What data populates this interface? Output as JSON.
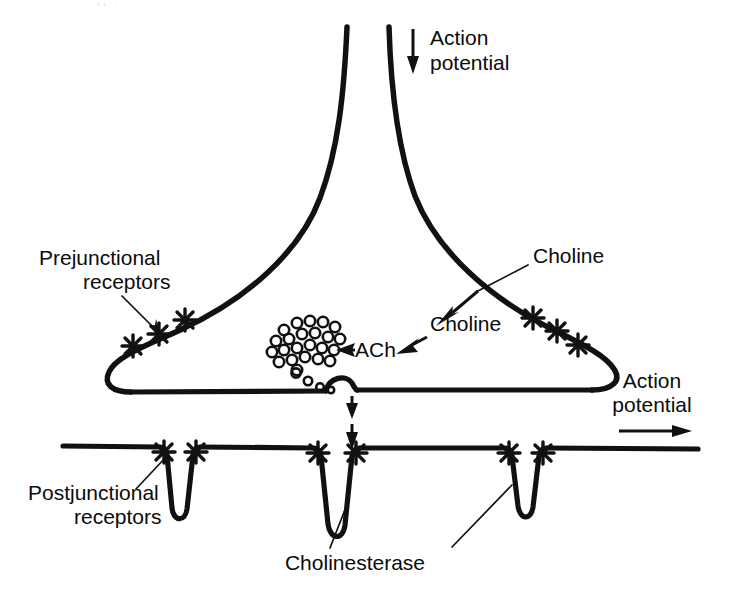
{
  "figure": {
    "background_color": "#ffffff",
    "ink_color": "#111111"
  },
  "labels": {
    "action_potential_top": "Action\npotential",
    "action_potential_top_line1": "Action",
    "action_potential_top_line2": "potential",
    "action_potential_right_line1": "Action",
    "action_potential_right_line2": "potential",
    "prejunctional_receptors_line1": "Prejunctional",
    "prejunctional_receptors_line2": "receptors",
    "postjunctional_receptors_line1": "Postjunctional",
    "postjunctional_receptors_line2": "receptors",
    "choline_outer": "Choline",
    "choline_inner": "Choline",
    "ach": "ACh",
    "cholinesterase": "Cholinesterase"
  },
  "structures": {
    "axon": "nerve axon flaring into terminal bouton",
    "nerve_terminal": "presynaptic nerve terminal (bouton)",
    "release_site": "vesicle fusion / release site bump on terminal membrane",
    "synaptic_cleft": "synaptic cleft between terminal and muscle membrane",
    "postjunctional_membrane": "postjunctional (muscle) membrane with junctional folds",
    "junctional_folds_count": 3,
    "prejunctional_receptor_marks_left": 3,
    "prejunctional_receptor_marks_right": 3,
    "postjunctional_receptor_mark_pairs": 3,
    "vesicle_cluster_count": 23,
    "released_vesicle_trail_count": 4
  },
  "arrows": {
    "action_potential_top_direction": "down",
    "action_potential_right_direction": "right",
    "choline_uptake_direction": "down-left across terminal membrane",
    "ach_synthesis_direction": "down-left toward vesicle pool",
    "transmitter_release_direction": "down across synaptic cleft",
    "transmitter_release_arrow_count": 2
  },
  "top_artifact": {
    "text": "·· ,"
  }
}
